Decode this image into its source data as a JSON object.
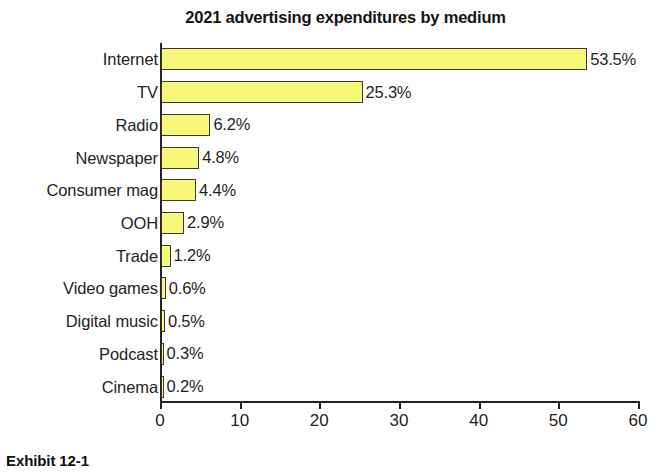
{
  "figure": {
    "caption": "Exhibit 12-1"
  },
  "chart_data": {
    "type": "bar",
    "orientation": "horizontal",
    "title": "2021 advertising expenditures by medium",
    "xlabel": "",
    "ylabel": "",
    "xlim": [
      0,
      60
    ],
    "xticks": [
      0,
      10,
      20,
      30,
      40,
      50,
      60
    ],
    "xtick_labels": [
      "0",
      "10",
      "20",
      "30",
      "40",
      "50",
      "60"
    ],
    "grid": false,
    "legend": false,
    "bar_color": "#f7f779",
    "bar_edge_color": "#3a3a30",
    "categories": [
      "Internet",
      "TV",
      "Radio",
      "Newspaper",
      "Consumer mag",
      "OOH",
      "Trade",
      "Video games",
      "Digital music",
      "Podcast",
      "Cinema"
    ],
    "values": [
      53.5,
      25.3,
      6.2,
      4.8,
      4.4,
      2.9,
      1.2,
      0.6,
      0.5,
      0.3,
      0.2
    ],
    "value_labels": [
      "53.5%",
      "25.3%",
      "6.2%",
      "4.8%",
      "4.4%",
      "2.9%",
      "1.2%",
      "0.6%",
      "0.5%",
      "0.3%",
      "0.2%"
    ]
  }
}
